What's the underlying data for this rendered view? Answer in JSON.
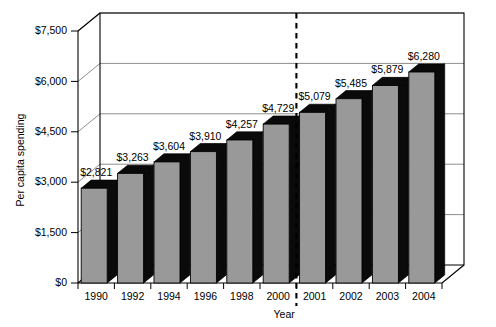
{
  "chart_data": {
    "type": "bar",
    "title": "",
    "subtitle": "",
    "xlabel": "Year",
    "ylabel": "Per capita spending",
    "categories": [
      "1990",
      "1992",
      "1994",
      "1996",
      "1998",
      "2000",
      "2001",
      "2002",
      "2003",
      "2004"
    ],
    "values": [
      2821,
      3263,
      3604,
      3910,
      4257,
      4729,
      5079,
      5485,
      5879,
      6280
    ],
    "value_labels": [
      "$2,821",
      "$3,263",
      "$3,604",
      "$3,910",
      "$4,257",
      "$4,729",
      "$5,079",
      "$5,485",
      "$5,879",
      "$6,280"
    ],
    "ylim": [
      0,
      7500
    ],
    "yticks": [
      0,
      1500,
      3000,
      4500,
      6000,
      7500
    ],
    "ytick_labels": [
      "$0",
      "$1,500",
      "$3,000",
      "$4,500",
      "$6,000",
      "$7,500"
    ],
    "grid": true,
    "legend": "none",
    "style": "3d-column",
    "series": [
      {
        "name": "Per capita spending",
        "values": [
          2821,
          3263,
          3604,
          3910,
          4257,
          4729,
          5079,
          5485,
          5879,
          6280
        ]
      }
    ],
    "annotations": [
      {
        "type": "vertical-dashed-divider",
        "between": [
          "2000",
          "2001"
        ],
        "label": ""
      }
    ],
    "colors": {
      "bar_front": "#999999",
      "bar_shadow": "#0a0a0a",
      "grid": "#808080",
      "axis": "#000000",
      "background": "#ffffff"
    }
  }
}
